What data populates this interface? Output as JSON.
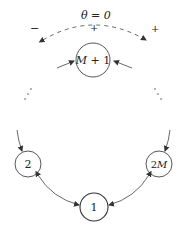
{
  "diagram": {
    "top_label": "θ = 0",
    "signs": {
      "left": "−",
      "middle": "+",
      "right": "+"
    },
    "nodes": [
      {
        "id": "top",
        "label_italic": "M",
        "label_rest": " + 1"
      },
      {
        "id": "left",
        "label": "2"
      },
      {
        "id": "right",
        "label_num": "2",
        "label_italic": "M"
      },
      {
        "id": "bottom",
        "label": "1"
      }
    ],
    "ellipsis": "⋯",
    "colors": {
      "stroke": "#444444",
      "text": "#222222",
      "background": "#ffffff"
    }
  }
}
